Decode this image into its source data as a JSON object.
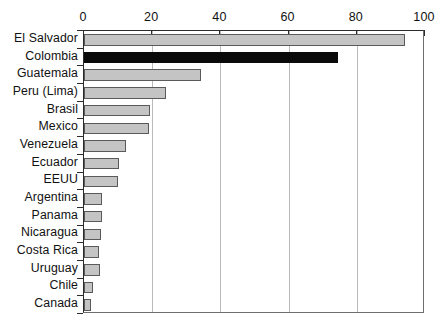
{
  "chart_data": {
    "type": "bar",
    "orientation": "horizontal",
    "title": "",
    "subtitle": "",
    "xlabel": "",
    "ylabel": "",
    "xlim": [
      0,
      100
    ],
    "ylim": null,
    "grid": true,
    "legend": null,
    "legend_position": "none",
    "xticks": [
      0,
      20,
      40,
      60,
      80,
      100
    ],
    "xtick_labels": [
      "0",
      "20",
      "40",
      "60",
      "80",
      "100"
    ],
    "categories": [
      "El Salvador",
      "Colombia",
      "Guatemala",
      "Peru (Lima)",
      "Brasil",
      "Mexico",
      "Venezuela",
      "Ecuador",
      "EEUU",
      "Argentina",
      "Panama",
      "Nicaragua",
      "Costa Rica",
      "Uruguay",
      "Chile",
      "Canada"
    ],
    "values": [
      94,
      74.5,
      34.3,
      24,
      19.5,
      19,
      12.3,
      10.3,
      10,
      5.3,
      5.3,
      5,
      4.4,
      4.7,
      2.6,
      2.1
    ],
    "highlight_category": "Colombia",
    "colors": {
      "bar_fill": "#c4c4c4",
      "bar_border": "#5a5a5a",
      "highlight_fill": "#0a0a0a",
      "gridline": "#b9b9b9",
      "axis": "#2b2b2b",
      "text": "#111111",
      "background": "#ffffff"
    }
  }
}
